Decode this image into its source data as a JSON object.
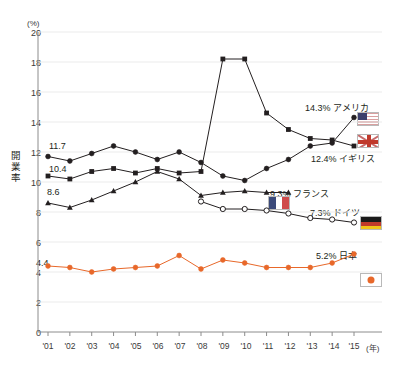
{
  "chart_data": {
    "type": "line",
    "title": "",
    "xlabel": "(年)",
    "ylabel": "開業率",
    "yunit": "(%)",
    "ylim": [
      0,
      20
    ],
    "yticks": [
      0,
      2,
      4,
      6,
      8,
      10,
      12,
      14,
      16,
      18,
      20
    ],
    "grid": true,
    "legend_position": "inline-right",
    "categories": [
      "'01",
      "'02",
      "'03",
      "'04",
      "'05",
      "'06",
      "'07",
      "'08",
      "'09",
      "'10",
      "'11",
      "'12",
      "'13",
      "'14",
      "'15"
    ],
    "series": [
      {
        "name": "アメリカ",
        "marker": "filled-circle",
        "color": "#231f20",
        "start_label": "11.7",
        "end_label": "14.3% アメリカ",
        "flag": "flag-us",
        "values": [
          11.7,
          11.4,
          11.9,
          12.4,
          12.0,
          11.5,
          12.0,
          11.3,
          10.4,
          10.1,
          10.9,
          11.5,
          12.4,
          12.6,
          14.3
        ]
      },
      {
        "name": "イギリス",
        "marker": "filled-square",
        "color": "#231f20",
        "start_label": "10.4",
        "end_label": "12.4% イギリス",
        "flag": "flag-uk",
        "values": [
          10.4,
          10.2,
          10.7,
          10.9,
          10.6,
          10.9,
          10.6,
          10.7,
          18.2,
          18.2,
          14.6,
          13.5,
          12.9,
          12.8,
          12.4
        ]
      },
      {
        "name": "フランス",
        "marker": "filled-triangle",
        "color": "#231f20",
        "start_label": "8.6",
        "end_label": "9.3% フランス",
        "flag": "flag-fr",
        "values": [
          8.6,
          8.3,
          8.8,
          9.4,
          10.0,
          10.7,
          10.2,
          9.1,
          9.3,
          9.4,
          9.3,
          9.3,
          null,
          null,
          null
        ]
      },
      {
        "name": "ドイツ",
        "marker": "open-circle",
        "color": "#231f20",
        "start_label": "",
        "end_label": "7.3% ドイツ",
        "flag": "flag-de",
        "values": [
          null,
          null,
          null,
          null,
          null,
          null,
          null,
          8.7,
          8.2,
          8.2,
          8.1,
          7.9,
          7.6,
          7.5,
          7.3
        ]
      },
      {
        "name": "日本",
        "marker": "filled-circle",
        "color": "#e8682a",
        "start_label": "4.4",
        "end_label": "5.2% 日本",
        "flag": "flag-jp",
        "values": [
          4.4,
          4.3,
          4.0,
          4.2,
          4.3,
          4.4,
          5.1,
          4.2,
          4.8,
          4.6,
          4.3,
          4.3,
          4.3,
          4.6,
          5.2
        ]
      }
    ]
  },
  "annotations": {
    "america": "14.3% アメリカ",
    "uk": "12.4% イギリス",
    "france": "9.3% フランス",
    "germany": "7.3% ドイツ",
    "japan": "5.2% 日本",
    "start_america": "11.7",
    "start_uk": "10.4",
    "start_france": "8.6",
    "start_japan": "4.4"
  },
  "axes": {
    "y_unit": "(%)",
    "y_axis_title": "開業率",
    "x_unit": "(年)",
    "yticks": [
      "20",
      "18",
      "16",
      "14",
      "12",
      "10",
      "8",
      "6",
      "4",
      "2",
      "0"
    ],
    "xticks": [
      "'01",
      "'02",
      "'03",
      "'04",
      "'05",
      "'06",
      "'07",
      "'08",
      "'09",
      "'10",
      "'11",
      "'12",
      "'13",
      "'14",
      "'15"
    ]
  },
  "colors": {
    "ink": "#231f20",
    "japan": "#e8682a",
    "grid": "#ebebeb",
    "axis": "#8c8c8c"
  }
}
